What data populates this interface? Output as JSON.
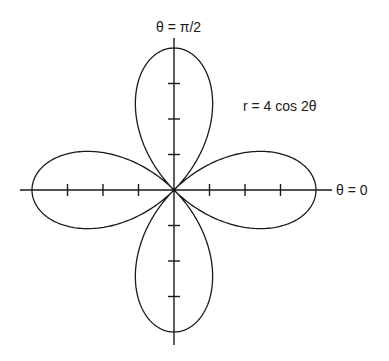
{
  "chart_data": {
    "type": "line",
    "subtype": "polar-rose",
    "title": "",
    "equation": "r = 4 cos 2θ",
    "amplitude": 4,
    "k": 2,
    "petals": 4,
    "theta_range": [
      0,
      6.283185307
    ],
    "axis_labels": {
      "polar_axis": "θ = 0",
      "vertical_axis": "θ = π/2"
    },
    "ticks_per_half_axis": [
      1,
      2,
      3
    ],
    "r_max": 4,
    "grid": false,
    "legend": null,
    "center_dot": true
  },
  "labels": {
    "equation": "r = 4 cos 2θ",
    "theta_zero": "θ = 0",
    "theta_half_pi": "θ = π/2"
  },
  "layout": {
    "cx": 174,
    "cy": 190,
    "unit_px": 35.5,
    "axis_h": [
      20,
      332
    ],
    "axis_v": [
      38,
      345
    ],
    "tick_half_len": 6,
    "stroke_color": "#1a1a1a",
    "background": "#ffffff"
  }
}
